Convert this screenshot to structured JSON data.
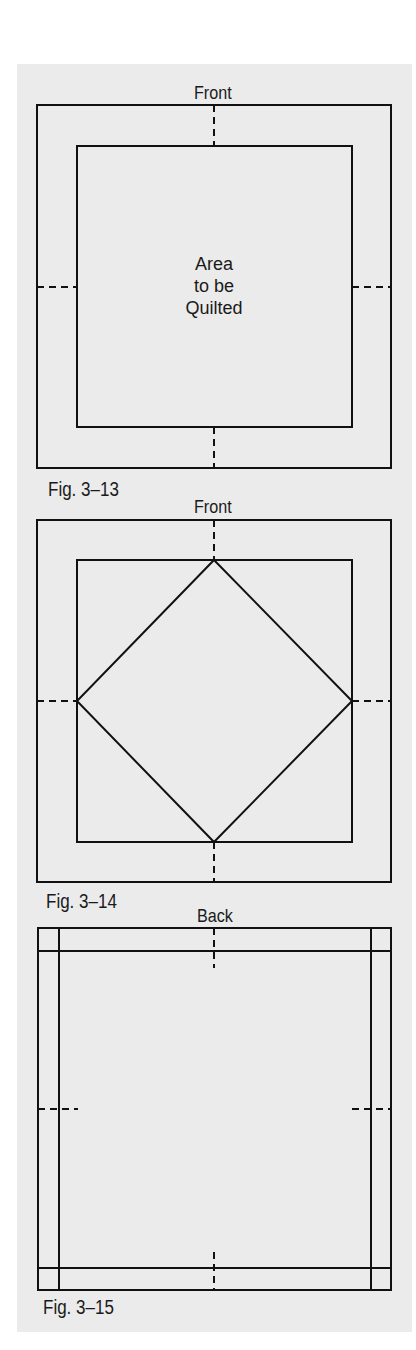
{
  "figures": [
    {
      "id": "fig-3-13",
      "side_label": "Front",
      "caption": "Fig. 3–13",
      "center_text": [
        "Area",
        "to be",
        "Quilted"
      ],
      "shape": "inner square"
    },
    {
      "id": "fig-3-14",
      "side_label": "Front",
      "caption": "Fig. 3–14",
      "shape": "inner square with diamond"
    },
    {
      "id": "fig-3-15",
      "side_label": "Back",
      "caption": "Fig. 3–15",
      "shape": "square with border grid lines"
    }
  ],
  "colors": {
    "panel_bg": "#ebebeb",
    "line": "#111111",
    "text": "#1a1a1a"
  }
}
